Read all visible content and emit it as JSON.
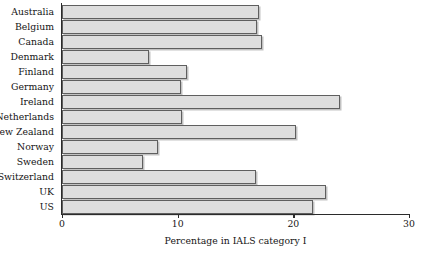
{
  "chart_data": {
    "type": "bar",
    "orientation": "horizontal",
    "title": "",
    "xlabel": "Percentage in IALS category I",
    "ylabel": "",
    "categories": [
      "Australia",
      "Belgium",
      "Canada",
      "Denmark",
      "Finland",
      "Germany",
      "Ireland",
      "Netherlands",
      "New Zealand",
      "Norway",
      "Sweden",
      "Switzerland",
      "UK",
      "US"
    ],
    "values": [
      17.0,
      16.9,
      17.3,
      7.5,
      10.8,
      10.3,
      24.0,
      10.4,
      20.2,
      8.3,
      7.0,
      16.8,
      22.8,
      21.7
    ],
    "xlim": [
      0,
      30
    ],
    "xticks": [
      0,
      10,
      20,
      30
    ],
    "xtick_labels": [
      "0",
      "10",
      "20",
      "30"
    ],
    "grid": false,
    "legend": false,
    "bar_color": "#dedede",
    "bar_border_color": "#5f5f5f",
    "axis_color": "#2b2b2b"
  }
}
